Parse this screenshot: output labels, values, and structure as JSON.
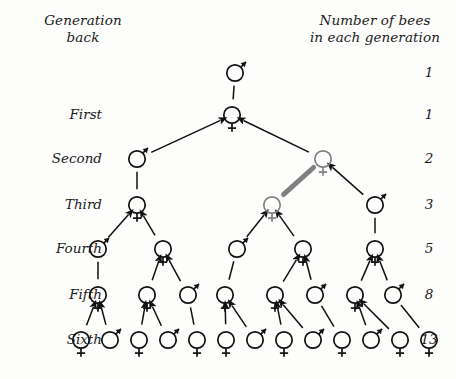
{
  "figure": {
    "title_left": "Generation\nback",
    "title_right": "Number of bees\nin each generation",
    "colors": {
      "ink": "#111111",
      "background": "#fdfdfc",
      "highlight": "#808080",
      "highlight_light": "#9a9a9a"
    }
  },
  "generation_labels": [
    {
      "id": "gen-0",
      "label": ""
    },
    {
      "id": "gen-1",
      "label": "First"
    },
    {
      "id": "gen-2",
      "label": "Second"
    },
    {
      "id": "gen-3",
      "label": "Third"
    },
    {
      "id": "gen-4",
      "label": "Fourth"
    },
    {
      "id": "gen-5",
      "label": "Fifth"
    },
    {
      "id": "gen-6",
      "label": "Sixth"
    }
  ],
  "counts": [
    {
      "id": "count-0",
      "value": "1"
    },
    {
      "id": "count-1",
      "value": "1"
    },
    {
      "id": "count-2",
      "value": "2"
    },
    {
      "id": "count-3",
      "value": "3"
    },
    {
      "id": "count-4",
      "value": "5"
    },
    {
      "id": "count-5",
      "value": "8"
    },
    {
      "id": "count-6",
      "value": "13"
    }
  ],
  "rows": [
    {
      "generation": "0",
      "y": 73,
      "count": 1,
      "nodes": [
        {
          "sex": "male",
          "x": 235,
          "highlight": false
        }
      ]
    },
    {
      "generation": "First",
      "y": 115,
      "count": 1,
      "nodes": [
        {
          "sex": "female",
          "x": 232,
          "highlight": false
        }
      ]
    },
    {
      "generation": "Second",
      "y": 159,
      "count": 2,
      "nodes": [
        {
          "sex": "male",
          "x": 137,
          "highlight": false
        },
        {
          "sex": "female",
          "x": 323,
          "highlight": true
        }
      ]
    },
    {
      "generation": "Third",
      "y": 205,
      "count": 3,
      "nodes": [
        {
          "sex": "female",
          "x": 137,
          "highlight": false
        },
        {
          "sex": "female",
          "x": 272,
          "highlight": true
        },
        {
          "sex": "male",
          "x": 375,
          "highlight": false
        }
      ]
    },
    {
      "generation": "Fourth",
      "y": 249,
      "count": 5,
      "nodes": [
        {
          "sex": "male",
          "x": 98,
          "highlight": false
        },
        {
          "sex": "female",
          "x": 163,
          "highlight": false
        },
        {
          "sex": "male",
          "x": 237,
          "highlight": false
        },
        {
          "sex": "female",
          "x": 303,
          "highlight": false
        },
        {
          "sex": "female",
          "x": 375,
          "highlight": false
        }
      ]
    },
    {
      "generation": "Fifth",
      "y": 295,
      "count": 8,
      "nodes": [
        {
          "sex": "female",
          "x": 98,
          "highlight": false
        },
        {
          "sex": "female",
          "x": 147,
          "highlight": false
        },
        {
          "sex": "male",
          "x": 188,
          "highlight": false
        },
        {
          "sex": "female",
          "x": 225,
          "highlight": false
        },
        {
          "sex": "female",
          "x": 275,
          "highlight": false
        },
        {
          "sex": "male",
          "x": 315,
          "highlight": false
        },
        {
          "sex": "female",
          "x": 355,
          "highlight": false
        },
        {
          "sex": "male",
          "x": 393,
          "highlight": false
        }
      ]
    },
    {
      "generation": "Sixth",
      "y": 340,
      "count": 13,
      "nodes": [
        {
          "sex": "female",
          "x": 81,
          "highlight": false
        },
        {
          "sex": "male",
          "x": 110,
          "highlight": false
        },
        {
          "sex": "female",
          "x": 139,
          "highlight": false
        },
        {
          "sex": "male",
          "x": 168,
          "highlight": false
        },
        {
          "sex": "female",
          "x": 197,
          "highlight": false
        },
        {
          "sex": "female",
          "x": 226,
          "highlight": false
        },
        {
          "sex": "male",
          "x": 255,
          "highlight": false
        },
        {
          "sex": "female",
          "x": 284,
          "highlight": false
        },
        {
          "sex": "male",
          "x": 313,
          "highlight": false
        },
        {
          "sex": "female",
          "x": 342,
          "highlight": false
        },
        {
          "sex": "male",
          "x": 371,
          "highlight": false
        },
        {
          "sex": "female",
          "x": 400,
          "highlight": false
        },
        {
          "sex": "female",
          "x": 429,
          "highlight": false
        }
      ]
    }
  ],
  "edges": [
    {
      "from": [
        0,
        0
      ],
      "to": [
        1,
        0
      ],
      "arrow": false,
      "highlight": false
    },
    {
      "from": [
        1,
        0
      ],
      "to": [
        2,
        0
      ],
      "arrow": true,
      "highlight": false
    },
    {
      "from": [
        1,
        0
      ],
      "to": [
        2,
        1
      ],
      "arrow": true,
      "highlight": false
    },
    {
      "from": [
        2,
        0
      ],
      "to": [
        3,
        0
      ],
      "arrow": false,
      "highlight": false
    },
    {
      "from": [
        2,
        1
      ],
      "to": [
        3,
        1
      ],
      "arrow": true,
      "highlight": true
    },
    {
      "from": [
        2,
        1
      ],
      "to": [
        3,
        2
      ],
      "arrow": true,
      "highlight": false
    },
    {
      "from": [
        3,
        0
      ],
      "to": [
        4,
        0
      ],
      "arrow": true,
      "highlight": false
    },
    {
      "from": [
        3,
        0
      ],
      "to": [
        4,
        1
      ],
      "arrow": true,
      "highlight": false
    },
    {
      "from": [
        3,
        1
      ],
      "to": [
        4,
        2
      ],
      "arrow": true,
      "highlight": false
    },
    {
      "from": [
        3,
        1
      ],
      "to": [
        4,
        3
      ],
      "arrow": true,
      "highlight": false
    },
    {
      "from": [
        3,
        2
      ],
      "to": [
        4,
        4
      ],
      "arrow": false,
      "highlight": false
    },
    {
      "from": [
        4,
        0
      ],
      "to": [
        5,
        0
      ],
      "arrow": false,
      "highlight": false
    },
    {
      "from": [
        4,
        1
      ],
      "to": [
        5,
        1
      ],
      "arrow": true,
      "highlight": false
    },
    {
      "from": [
        4,
        1
      ],
      "to": [
        5,
        2
      ],
      "arrow": true,
      "highlight": false
    },
    {
      "from": [
        4,
        2
      ],
      "to": [
        5,
        3
      ],
      "arrow": false,
      "highlight": false
    },
    {
      "from": [
        4,
        3
      ],
      "to": [
        5,
        4
      ],
      "arrow": true,
      "highlight": false
    },
    {
      "from": [
        4,
        3
      ],
      "to": [
        5,
        5
      ],
      "arrow": true,
      "highlight": false
    },
    {
      "from": [
        4,
        4
      ],
      "to": [
        5,
        6
      ],
      "arrow": true,
      "highlight": false
    },
    {
      "from": [
        4,
        4
      ],
      "to": [
        5,
        7
      ],
      "arrow": true,
      "highlight": false
    },
    {
      "from": [
        5,
        0
      ],
      "to": [
        6,
        0
      ],
      "arrow": true,
      "highlight": false
    },
    {
      "from": [
        5,
        0
      ],
      "to": [
        6,
        1
      ],
      "arrow": true,
      "highlight": false
    },
    {
      "from": [
        5,
        1
      ],
      "to": [
        6,
        2
      ],
      "arrow": true,
      "highlight": false
    },
    {
      "from": [
        5,
        1
      ],
      "to": [
        6,
        3
      ],
      "arrow": true,
      "highlight": false
    },
    {
      "from": [
        5,
        2
      ],
      "to": [
        6,
        4
      ],
      "arrow": false,
      "highlight": false
    },
    {
      "from": [
        5,
        3
      ],
      "to": [
        6,
        5
      ],
      "arrow": true,
      "highlight": false
    },
    {
      "from": [
        5,
        3
      ],
      "to": [
        6,
        6
      ],
      "arrow": true,
      "highlight": false
    },
    {
      "from": [
        5,
        4
      ],
      "to": [
        6,
        7
      ],
      "arrow": true,
      "highlight": false
    },
    {
      "from": [
        5,
        4
      ],
      "to": [
        6,
        8
      ],
      "arrow": true,
      "highlight": false
    },
    {
      "from": [
        5,
        5
      ],
      "to": [
        6,
        9
      ],
      "arrow": false,
      "highlight": false
    },
    {
      "from": [
        5,
        6
      ],
      "to": [
        6,
        10
      ],
      "arrow": true,
      "highlight": false
    },
    {
      "from": [
        5,
        6
      ],
      "to": [
        6,
        11
      ],
      "arrow": true,
      "highlight": false
    },
    {
      "from": [
        5,
        7
      ],
      "to": [
        6,
        12
      ],
      "arrow": false,
      "highlight": false
    }
  ],
  "label_positions": {
    "gen_label_x": 12,
    "count_label_x": 412
  }
}
